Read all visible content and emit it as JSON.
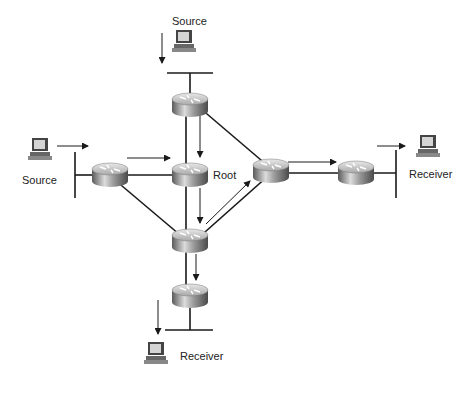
{
  "diagram": {
    "type": "multicast-shared-tree",
    "nodes": {
      "source_top": {
        "label": "Source",
        "kind": "pc"
      },
      "source_left": {
        "label": "Source",
        "kind": "pc"
      },
      "root": {
        "label": "Root",
        "kind": "router"
      },
      "receiver_right": {
        "label": "Receiver",
        "kind": "pc"
      },
      "receiver_bottom": {
        "label": "Receiver",
        "kind": "pc"
      }
    },
    "routers": [
      "router-top",
      "router-left",
      "router-root",
      "router-right-center",
      "router-right",
      "router-middle-lower",
      "router-bottom"
    ],
    "colors": {
      "line": "#1a1a1a",
      "router_light": "#d8d8d8",
      "router_dark": "#6a6a6a",
      "pc_screen": "#cfcfcf"
    }
  }
}
